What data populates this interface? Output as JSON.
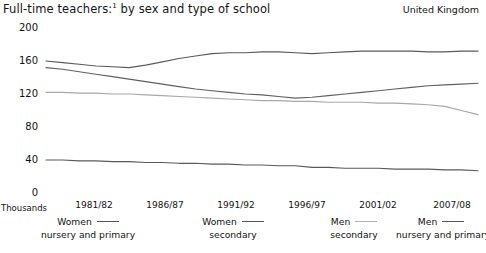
{
  "header": {
    "title": "Full-time teachers:",
    "title_footnote": "1",
    "title_rest": " by sex and type of school",
    "region": "United Kingdom"
  },
  "axes": {
    "yticks": [
      "200",
      "160",
      "120",
      "80",
      "40",
      "0"
    ],
    "units_label": "Thousands",
    "xticks": [
      "1981/82",
      "1986/87",
      "1991/92",
      "1996/97",
      "2001/02",
      "2007/08"
    ]
  },
  "legend": [
    {
      "name": "women-nursery-primary",
      "line1": "Women",
      "line2": "nursery and primary",
      "color": "#5a5a5a"
    },
    {
      "name": "women-secondary",
      "line1": "Women",
      "line2": "secondary",
      "color": "#606060"
    },
    {
      "name": "men-secondary",
      "line1": "Men",
      "line2": "secondary",
      "color": "#a8a8a8"
    },
    {
      "name": "men-nursery-primary",
      "line1": "Men",
      "line2": "nursery and primary",
      "color": "#5a5a5a"
    }
  ],
  "chart_data": {
    "type": "line",
    "subtitle": "United Kingdom",
    "xlabel": "",
    "ylabel": "Thousands",
    "ylim": [
      0,
      200
    ],
    "yticks": [
      0,
      40,
      80,
      120,
      160,
      200
    ],
    "grid": false,
    "legend_position": "bottom",
    "x": [
      "1981/82",
      "1982/83",
      "1983/84",
      "1984/85",
      "1985/86",
      "1986/87",
      "1987/88",
      "1988/89",
      "1989/90",
      "1990/91",
      "1991/92",
      "1992/93",
      "1993/94",
      "1994/95",
      "1995/96",
      "1996/97",
      "1997/98",
      "1998/99",
      "1999/00",
      "2000/01",
      "2001/02",
      "2002/03",
      "2003/04",
      "2004/05",
      "2005/06",
      "2006/07",
      "2007/08"
    ],
    "series": [
      {
        "name": "Women nursery and primary",
        "color": "#5a5a5a",
        "values": [
          160,
          158,
          156,
          154,
          153,
          152,
          155,
          159,
          163,
          166,
          169,
          170,
          170,
          171,
          171,
          170,
          169,
          170,
          171,
          172,
          172,
          172,
          172,
          171,
          171,
          172,
          172
        ]
      },
      {
        "name": "Women secondary",
        "color": "#606060",
        "values": [
          152,
          150,
          147,
          144,
          141,
          138,
          135,
          132,
          129,
          126,
          124,
          122,
          120,
          119,
          117,
          115,
          116,
          118,
          120,
          122,
          124,
          126,
          128,
          130,
          131,
          132,
          133
        ]
      },
      {
        "name": "Men secondary",
        "color": "#a8a8a8",
        "values": [
          122,
          122,
          121,
          121,
          120,
          120,
          119,
          118,
          117,
          116,
          115,
          114,
          113,
          112,
          112,
          111,
          111,
          110,
          110,
          110,
          109,
          109,
          108,
          107,
          105,
          100,
          95
        ]
      },
      {
        "name": "Men nursery and primary",
        "color": "#5a5a5a",
        "values": [
          40,
          40,
          39,
          39,
          38,
          38,
          37,
          37,
          36,
          36,
          35,
          35,
          34,
          34,
          33,
          33,
          31,
          31,
          30,
          30,
          30,
          29,
          29,
          29,
          28,
          28,
          27
        ]
      }
    ]
  },
  "geometry": {
    "plot_left": 46,
    "plot_right": 478,
    "y_top_px": 28,
    "y_bottom_px": 193,
    "ytick_y": [
      28,
      61,
      94,
      127,
      160,
      193
    ],
    "xtick_center": [
      94,
      165,
      236,
      307,
      378,
      452
    ]
  }
}
